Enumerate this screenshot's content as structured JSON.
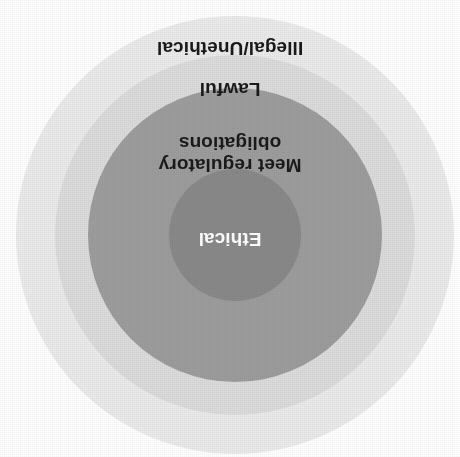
{
  "diagram": {
    "type": "concentric-circles",
    "orientation_degrees": 180,
    "background_color": "#ffffff",
    "center": {
      "x": 225,
      "y": 222
    },
    "rings": [
      {
        "id": "illegal",
        "label": "Illegal/Unethical",
        "color": "#ebebeb",
        "text_color": "#1a1a1a",
        "radius": 219,
        "level": 4
      },
      {
        "id": "lawful",
        "label": "Lawful",
        "color": "#dcdcdc",
        "text_color": "#1a1a1a",
        "radius": 180,
        "level": 3
      },
      {
        "id": "regulatory",
        "label": "Meet regulatory\nobligations",
        "color": "#9d9d9d",
        "text_color": "#1a1a1a",
        "radius": 147,
        "level": 2
      },
      {
        "id": "ethical",
        "label": "Ethical",
        "color": "#898989",
        "text_color": "#ffffff",
        "radius": 66,
        "level": 1
      }
    ]
  }
}
